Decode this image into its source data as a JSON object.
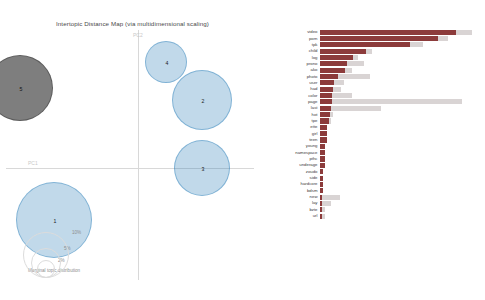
{
  "left_panel": {
    "title": "Intertopic Distance Map (via multidimensional scaling)",
    "axis_labels": {
      "x": "PC1",
      "y": "PC2"
    },
    "marginal_legend": {
      "label": "Marginal topic distribution",
      "sizes": [
        "2%",
        "5%",
        "10%"
      ]
    },
    "topics": [
      {
        "id": "5",
        "label": "5",
        "x": 14,
        "y": 58,
        "r": 33,
        "selected": true
      },
      {
        "id": "4",
        "label": "4",
        "x": 160,
        "y": 32,
        "r": 21,
        "selected": false
      },
      {
        "id": "2",
        "label": "2",
        "x": 196,
        "y": 70,
        "r": 30,
        "selected": false
      },
      {
        "id": "3",
        "label": "3",
        "x": 196,
        "y": 138,
        "r": 28,
        "selected": false
      },
      {
        "id": "1",
        "label": "1",
        "x": 48,
        "y": 190,
        "r": 38,
        "selected": false
      }
    ]
  },
  "right_panel": {
    "title": "Top-30 Most Relevant Terms for Topic 5 (10.4% of tokens)",
    "topic_number": "5",
    "topic_share": "10.4% of tokens",
    "legend": [
      {
        "swatch": "overall",
        "label": "Overall term frequency"
      },
      {
        "swatch": "topic",
        "label": "Estimated term frequency within the selected topic"
      }
    ],
    "notes": [
      "1. saliency(term w) = frequency(w) * [sum_t p(t | w) * log(p(t | w)/p(t))] for topics t; see Chuang et. al (2012)",
      "2. relevance(term w | topic t) = λ * p(w | t) + (1 - λ) * p(w | t)/p(w); see Sievert & Shirley (2014)"
    ]
  },
  "chart_data": {
    "type": "bar",
    "title": "Top-30 Most Relevant Terms for Topic 5 (10.4% of tokens)",
    "orientation": "horizontal",
    "xlabel": "",
    "ylabel": "",
    "xlim": [
      0,
      163
    ],
    "grid": false,
    "legend_position": "bottom",
    "categories": [
      "video",
      "porn",
      "tpk",
      "child",
      "log",
      "prono",
      "ako",
      "photo",
      "user",
      "had",
      "color",
      "page",
      "last",
      "hot",
      "tpe",
      "ette",
      "girl",
      "teen",
      "young",
      "namespace",
      "pthc",
      "underage",
      "zoudo",
      "side",
      "hardcore",
      "bdsm",
      "new",
      "lay",
      "bzte",
      "url"
    ],
    "series": [
      {
        "name": "Overall term frequency",
        "values": [
          152,
          128,
          103,
          52,
          38,
          44,
          32,
          50,
          24,
          21,
          32,
          142,
          62,
          13,
          11,
          8,
          8,
          7,
          6,
          6,
          5,
          5,
          4,
          4,
          4,
          4,
          20,
          11,
          6,
          5
        ]
      },
      {
        "name": "Estimated term frequency within the selected topic",
        "values": [
          136,
          118,
          90,
          46,
          33,
          27,
          25,
          18,
          14,
          13,
          12,
          12,
          11,
          10,
          9,
          8,
          8,
          7,
          6,
          6,
          5,
          5,
          4,
          4,
          4,
          4,
          3,
          3,
          3,
          3
        ]
      }
    ]
  }
}
